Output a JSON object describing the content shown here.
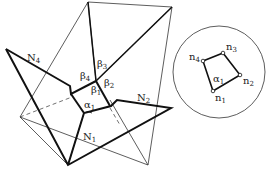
{
  "figure": {
    "main_labels": {
      "N4": {
        "base": "N",
        "sub": "4"
      },
      "N2": {
        "base": "N",
        "sub": "2"
      },
      "N1": {
        "base": "N",
        "sub": "1"
      },
      "beta1": {
        "base": "β",
        "sub": "1"
      },
      "beta2": {
        "base": "β",
        "sub": "2"
      },
      "beta3": {
        "base": "β",
        "sub": "3"
      },
      "beta4": {
        "base": "β",
        "sub": "4"
      },
      "alpha1": {
        "base": "α",
        "sub": "1"
      }
    },
    "sphere_labels": {
      "n1": {
        "base": "n",
        "sub": "1"
      },
      "n2": {
        "base": "n",
        "sub": "2"
      },
      "n3": {
        "base": "n",
        "sub": "3"
      },
      "n4": {
        "base": "n",
        "sub": "4"
      },
      "alpha1": {
        "base": "α",
        "sub": "1"
      }
    }
  }
}
